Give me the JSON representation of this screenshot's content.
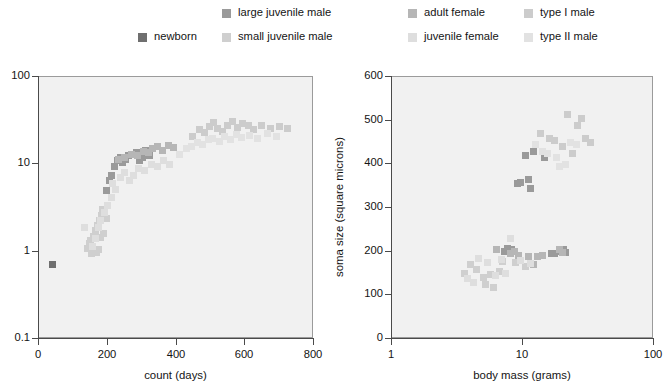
{
  "legend": {
    "rows": [
      [
        {
          "label": "large juvenile male",
          "color": "#9a9a9a",
          "x": 222
        },
        {
          "label": "adult female",
          "color": "#b6b6b6",
          "x": 408
        },
        {
          "label": "type I male",
          "color": "#cccccc",
          "x": 524
        }
      ],
      [
        {
          "label": "newborn",
          "color": "#6f6f6f",
          "x": 138
        },
        {
          "label": "small juvenile male",
          "color": "#cfcfcf",
          "x": 222
        },
        {
          "label": "juvenile female",
          "color": "#dedede",
          "x": 408
        },
        {
          "label": "type II male",
          "color": "#e2e2e2",
          "x": 524
        }
      ]
    ]
  },
  "colors": {
    "newborn": "#6f6f6f",
    "large_juvenile_male": "#9a9a9a",
    "small_juvenile_male": "#cfcfcf",
    "adult_female": "#b6b6b6",
    "juvenile_female": "#dedede",
    "type_I_male": "#cccccc",
    "type_II_male": "#e2e2e2",
    "plot_background": "#f1f1f1",
    "axis": "#4a4a4a",
    "plot_border": "#9b9b9b"
  },
  "chart_data": [
    {
      "type": "scatter",
      "title": "",
      "xlabel": "count (days)",
      "ylabel": "body mass (grams)",
      "xscale": "linear",
      "yscale": "log",
      "xlim": [
        0,
        800
      ],
      "ylim": [
        0.1,
        100
      ],
      "xticks": [
        "0",
        "200",
        "400",
        "600",
        "800"
      ],
      "xtickvalues": [
        0,
        200,
        400,
        600,
        800
      ],
      "yticks": [
        "0.1",
        "1",
        "10",
        "100"
      ],
      "ytickvalues": [
        0.1,
        1,
        10,
        100
      ],
      "grid": false,
      "legend_position": "top",
      "series": [
        {
          "name": "newborn",
          "color": "#6f6f6f",
          "points": [
            [
              40,
              0.72
            ]
          ]
        },
        {
          "name": "small juvenile male",
          "color": "#cfcfcf",
          "points": [
            [
              152,
              0.95
            ],
            [
              160,
              1.0
            ],
            [
              166,
              0.98
            ],
            [
              172,
              1.05
            ],
            [
              150,
              1.35
            ],
            [
              158,
              1.5
            ],
            [
              164,
              1.75
            ],
            [
              170,
              2.0
            ],
            [
              176,
              2.25
            ],
            [
              182,
              2.6
            ],
            [
              188,
              1.6
            ],
            [
              196,
              2.4
            ],
            [
              140,
              1.1
            ],
            [
              146,
              1.25
            ],
            [
              178,
              1.45
            ],
            [
              186,
              3.0
            ]
          ]
        },
        {
          "name": "large juvenile male",
          "color": "#9a9a9a",
          "points": [
            [
              196,
              5.0
            ],
            [
              204,
              6.5
            ],
            [
              212,
              7.5
            ],
            [
              220,
              9.5
            ],
            [
              228,
              11.0
            ],
            [
              236,
              12.0
            ],
            [
              244,
              10.5
            ],
            [
              252,
              11.5
            ],
            [
              260,
              12.5
            ],
            [
              272,
              13.0
            ],
            [
              284,
              13.5
            ],
            [
              292,
              11.0
            ],
            [
              300,
              12.0
            ],
            [
              310,
              14.5
            ],
            [
              322,
              12.5
            ]
          ]
        },
        {
          "name": "adult female",
          "color": "#b6b6b6",
          "points": [
            [
              232,
              11.5
            ],
            [
              250,
              12.0
            ],
            [
              268,
              13.0
            ],
            [
              286,
              12.5
            ],
            [
              304,
              14.0
            ],
            [
              318,
              13.5
            ],
            [
              330,
              15.0
            ],
            [
              346,
              16.0
            ],
            [
              360,
              14.5
            ],
            [
              378,
              16.5
            ],
            [
              392,
              15.5
            ]
          ]
        },
        {
          "name": "juvenile female",
          "color": "#dedede",
          "points": [
            [
              156,
              1.15
            ],
            [
              164,
              1.4
            ],
            [
              172,
              1.9
            ],
            [
              180,
              2.3
            ],
            [
              190,
              2.8
            ],
            [
              200,
              3.4
            ],
            [
              210,
              4.2
            ],
            [
              222,
              5.2
            ],
            [
              132,
              1.9
            ],
            [
              214,
              6.0
            ],
            [
              236,
              7.0
            ],
            [
              248,
              8.0
            ],
            [
              262,
              6.5
            ],
            [
              276,
              7.5
            ],
            [
              290,
              9.0
            ],
            [
              308,
              8.5
            ],
            [
              326,
              10.0
            ],
            [
              344,
              9.5
            ],
            [
              362,
              11.0
            ],
            [
              380,
              10.0
            ]
          ]
        },
        {
          "name": "type I male",
          "color": "#cccccc",
          "points": [
            [
              446,
              21.0
            ],
            [
              468,
              25.0
            ],
            [
              482,
              23.0
            ],
            [
              496,
              27.0
            ],
            [
              508,
              30.0
            ],
            [
              520,
              26.0
            ],
            [
              534,
              24.0
            ],
            [
              548,
              28.0
            ],
            [
              562,
              31.0
            ],
            [
              576,
              26.5
            ],
            [
              592,
              29.0
            ],
            [
              608,
              27.5
            ],
            [
              624,
              25.0
            ],
            [
              648,
              28.0
            ],
            [
              672,
              26.0
            ],
            [
              700,
              27.0
            ],
            [
              722,
              25.5
            ]
          ]
        },
        {
          "name": "type II male",
          "color": "#e2e2e2",
          "points": [
            [
              410,
              13.0
            ],
            [
              428,
              15.0
            ],
            [
              444,
              16.0
            ],
            [
              460,
              18.0
            ],
            [
              476,
              17.0
            ],
            [
              492,
              19.0
            ],
            [
              506,
              20.0
            ],
            [
              524,
              18.5
            ],
            [
              540,
              21.0
            ],
            [
              556,
              19.5
            ],
            [
              574,
              22.0
            ],
            [
              590,
              20.5
            ],
            [
              612,
              21.5
            ],
            [
              636,
              20.0
            ],
            [
              666,
              22.5
            ],
            [
              690,
              21.0
            ]
          ]
        }
      ]
    },
    {
      "type": "scatter",
      "title": "",
      "xlabel": "body mass (grams)",
      "ylabel": "soma size (square microns)",
      "xscale": "log",
      "yscale": "linear",
      "xlim": [
        1,
        100
      ],
      "ylim": [
        0,
        600
      ],
      "xticks": [
        "1",
        "10",
        "100"
      ],
      "xtickvalues": [
        1,
        10,
        100
      ],
      "yticks": [
        "0",
        "100",
        "200",
        "300",
        "400",
        "500",
        "600"
      ],
      "ytickvalues": [
        0,
        100,
        200,
        300,
        400,
        500,
        600
      ],
      "grid": false,
      "legend_position": "top",
      "series": [
        {
          "name": "large juvenile male",
          "color": "#9a9a9a",
          "points": [
            [
              9.0,
              355
            ],
            [
              9.6,
              358
            ],
            [
              10.5,
              420
            ],
            [
              12.0,
              430
            ],
            [
              14.5,
              415
            ],
            [
              11.0,
              365
            ],
            [
              11.4,
              345
            ],
            [
              19.5,
              200
            ],
            [
              20.5,
              205
            ],
            [
              21.0,
              197
            ],
            [
              7.2,
              200
            ],
            [
              7.6,
              208
            ],
            [
              8.2,
              205
            ],
            [
              16.5,
              195
            ],
            [
              17.5,
              196
            ]
          ]
        },
        {
          "name": "adult female",
          "color": "#b6b6b6",
          "points": [
            [
              8.0,
              195
            ],
            [
              8.6,
              200
            ],
            [
              9.2,
              192
            ],
            [
              6.3,
              205
            ],
            [
              13.0,
              190
            ],
            [
              14.0,
              192
            ],
            [
              11.0,
              188
            ],
            [
              12.0,
              170
            ],
            [
              19.0,
              205
            ],
            [
              20.0,
              198
            ]
          ]
        },
        {
          "name": "small juvenile male",
          "color": "#cfcfcf",
          "points": [
            [
              4.4,
              160
            ],
            [
              5.0,
              140
            ],
            [
              5.6,
              148
            ],
            [
              6.6,
              155
            ],
            [
              4.0,
              170
            ],
            [
              7.0,
              178
            ],
            [
              8.8,
              175
            ],
            [
              3.6,
              150
            ],
            [
              10.5,
              165
            ],
            [
              5.2,
              125
            ],
            [
              6.0,
              118
            ]
          ]
        },
        {
          "name": "juvenile female",
          "color": "#dedede",
          "points": [
            [
              4.6,
              185
            ],
            [
              5.4,
              175
            ],
            [
              6.8,
              182
            ],
            [
              8.0,
              230
            ],
            [
              9.5,
              180
            ],
            [
              11.5,
              172
            ],
            [
              3.8,
              138
            ],
            [
              4.2,
              130
            ],
            [
              6.2,
              145
            ],
            [
              7.4,
              150
            ]
          ]
        },
        {
          "name": "type I male",
          "color": "#cccccc",
          "points": [
            [
              16.0,
              460
            ],
            [
              17.5,
              455
            ],
            [
              22.0,
              515
            ],
            [
              26.0,
              490
            ],
            [
              30.0,
              460
            ],
            [
              33.0,
              450
            ],
            [
              28.0,
              505
            ],
            [
              20.0,
              440
            ],
            [
              24.0,
              425
            ],
            [
              13.5,
              470
            ]
          ]
        },
        {
          "name": "type II male",
          "color": "#e2e2e2",
          "points": [
            [
              14.0,
              430
            ],
            [
              15.5,
              425
            ],
            [
              18.0,
              415
            ],
            [
              12.5,
              445
            ],
            [
              21.0,
              400
            ],
            [
              19.0,
              395
            ],
            [
              23.0,
              450
            ],
            [
              25.5,
              445
            ]
          ]
        }
      ]
    }
  ],
  "charts": [
    {
      "id": "left",
      "frame": {
        "left": 38,
        "top": 76,
        "width": 275,
        "height": 262
      }
    },
    {
      "id": "right",
      "frame": {
        "left": 391,
        "top": 76,
        "width": 262,
        "height": 262
      }
    }
  ]
}
